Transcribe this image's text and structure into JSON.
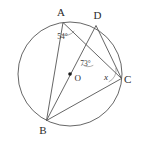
{
  "figure": {
    "kind": "circle-geometry-diagram",
    "background_color": "#ffffff",
    "stroke_color": "#555555",
    "label_color": "#2b2b2b",
    "width": 142,
    "height": 144
  },
  "circle": {
    "center_label": "O",
    "center_x": 70,
    "center_y": 74,
    "radius": 52,
    "center_dot_radius": 1.8
  },
  "points": [
    {
      "name": "A",
      "label": "A",
      "x": 63.0,
      "y": 22.5,
      "label_x": 61.0,
      "label_y": 15.5
    },
    {
      "name": "D",
      "label": "D",
      "x": 96.0,
      "y": 25.5,
      "label_x": 97.5,
      "label_y": 19.0
    },
    {
      "name": "C",
      "label": "C",
      "x": 121.5,
      "y": 78.5,
      "label_x": 124.0,
      "label_y": 82.5
    },
    {
      "name": "B",
      "label": "B",
      "x": 46.5,
      "y": 120.5,
      "label_x": 43.0,
      "label_y": 134.0
    }
  ],
  "chords": [
    {
      "name": "AB",
      "from": "A",
      "to": "B"
    },
    {
      "name": "AC",
      "from": "A",
      "to": "C"
    },
    {
      "name": "BD",
      "from": "B",
      "to": "D"
    },
    {
      "name": "BC",
      "from": "B",
      "to": "C"
    },
    {
      "name": "DC",
      "from": "D",
      "to": "C"
    }
  ],
  "intersection": {
    "name": "P",
    "x": 88.5,
    "y": 56.5,
    "description": "intersection of chord AC and chord BD"
  },
  "angles": [
    {
      "name": "angle-at-A",
      "label": "54°",
      "value": 54,
      "vertex": "A",
      "between": [
        "AB",
        "AC"
      ],
      "label_x": 62.5,
      "label_y": 39.0,
      "arc": {
        "cx": 63.0,
        "cy": 22.5,
        "r": 12
      }
    },
    {
      "name": "angle-at-intersection",
      "label": "73°",
      "value": 73,
      "vertex": "P",
      "between": [
        "PA",
        "PD"
      ],
      "label_x": 85.5,
      "label_y": 65.5,
      "arc": {
        "cx": 88.5,
        "cy": 56.5,
        "r": 10
      }
    },
    {
      "name": "angle-at-C-unknown",
      "label": "x",
      "value": null,
      "vertex": "C",
      "between": [
        "CB",
        "CD"
      ],
      "label_x": 106.0,
      "label_y": 79.5,
      "arc": {
        "cx": 121.5,
        "cy": 78.5,
        "r": 13
      }
    }
  ]
}
